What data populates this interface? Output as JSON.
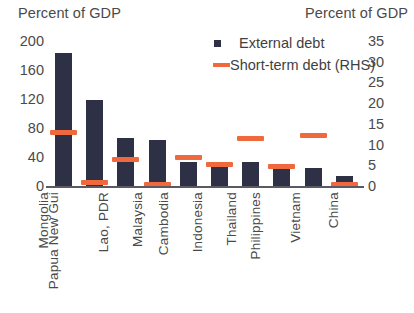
{
  "chart_data": {
    "type": "bar",
    "title": "",
    "left_axis_caption": "Percent of GDP",
    "right_axis_caption": "Percent of GDP",
    "xlabel": "",
    "ylabel": "",
    "grid": false,
    "legend_position": "top-right",
    "ylim": [
      0,
      200
    ],
    "y2lim": [
      0,
      35
    ],
    "yticks": [
      "200",
      "160",
      "120",
      "80",
      "40",
      "0"
    ],
    "y2ticks": [
      "35",
      "30",
      "25",
      "20",
      "15",
      "10",
      "5",
      "0"
    ],
    "categories": [
      "Mongolia",
      "Papua New Gui",
      "Lao, PDR",
      "Malaysia",
      "Cambodia",
      "Indonesia",
      "Thailand",
      "Philippines",
      "Vietnam",
      "China"
    ],
    "series": [
      {
        "name": "External debt",
        "axis": "left",
        "type": "bar",
        "color": "#2e3145",
        "values": [
          183,
          118,
          66,
          63,
          33,
          27,
          33,
          25,
          25,
          14
        ]
      },
      {
        "name": "Short-term debt (RHS)",
        "axis": "right",
        "type": "marker",
        "color": "#f0693c",
        "values": [
          12.8,
          0.9,
          6.3,
          0.3,
          6.8,
          5.2,
          11.5,
          4.7,
          12.2,
          0.4
        ]
      }
    ]
  },
  "legend": {
    "items": [
      {
        "label": "External debt",
        "marker": "square-marker"
      },
      {
        "label": "Short-term debt (RHS)",
        "marker": "dash-marker"
      }
    ]
  }
}
